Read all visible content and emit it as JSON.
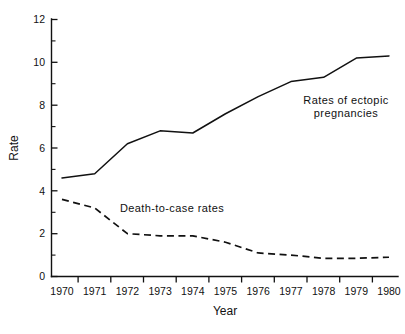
{
  "chart_data": {
    "type": "line",
    "title": "",
    "xlabel": "Year",
    "ylabel": "Rate",
    "x": [
      1970,
      1971,
      1972,
      1973,
      1974,
      1975,
      1976,
      1977,
      1978,
      1979,
      1980
    ],
    "xtick_labels": [
      "1970",
      "1971",
      "1972",
      "1973",
      "1974",
      "1975",
      "1976",
      "1977",
      "1978",
      "1979",
      "1980"
    ],
    "ytick_labels": [
      "0",
      "2",
      "4",
      "6",
      "8",
      "10",
      "12"
    ],
    "yticks": [
      0,
      2,
      4,
      6,
      8,
      10,
      12
    ],
    "ylim": [
      0,
      12
    ],
    "xlim": [
      1970,
      1980
    ],
    "y_minor_ticks": [
      1,
      3,
      5,
      7,
      9,
      11
    ],
    "grid": false,
    "legend_position": "inline-annotation",
    "series": [
      {
        "name": "Rates of ectopic pregnancies",
        "style": "solid",
        "color": "#111111",
        "values": [
          4.6,
          4.8,
          6.2,
          6.8,
          6.7,
          7.6,
          8.4,
          9.1,
          9.3,
          10.2,
          10.3
        ]
      },
      {
        "name": "Death-to-case rates",
        "style": "dashed",
        "color": "#111111",
        "values": [
          3.6,
          3.2,
          2.0,
          1.9,
          1.9,
          1.6,
          1.1,
          1.0,
          0.85,
          0.85,
          0.9
        ]
      }
    ],
    "annotations": [
      {
        "id": "solid-label-line1",
        "text": "Rates of ectopic",
        "x": 1977.4,
        "y": 8.35
      },
      {
        "id": "solid-label-line2",
        "text": "pregnancies",
        "x": 1977.4,
        "y": 7.7
      },
      {
        "id": "dashed-label",
        "text": "Death-to-case rates",
        "x": 1973.2,
        "y": 2.95
      }
    ]
  },
  "axes": {
    "y_title": "Rate",
    "x_title": "Year"
  },
  "caption": {
    "ghost_text": ""
  }
}
